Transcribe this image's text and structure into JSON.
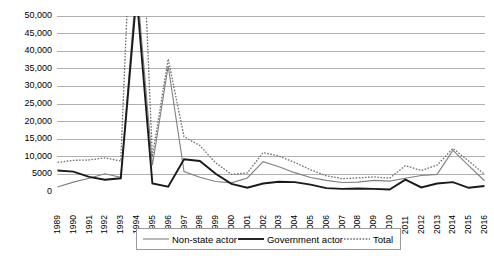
{
  "chart_data": {
    "type": "line",
    "title": "",
    "subtitle": "",
    "xlabel": "",
    "ylabel": "",
    "ylim": [
      0,
      50000
    ],
    "xlim": [
      "1989",
      "2016"
    ],
    "grid": true,
    "legend_position": "bottom",
    "ytick_labels": [
      "50,000",
      "45,000",
      "40,000",
      "35,000",
      "30,000",
      "25,000",
      "20,000",
      "15,000",
      "10,000",
      "5000",
      "0"
    ],
    "ytick_values": [
      50000,
      45000,
      40000,
      35000,
      30000,
      25000,
      20000,
      15000,
      10000,
      5000,
      0
    ],
    "categories": [
      "1989",
      "1990",
      "1991",
      "1992",
      "1993",
      "1994",
      "1995",
      "1996",
      "1997",
      "1998",
      "1999",
      "2000",
      "2001",
      "2002",
      "2003",
      "2004",
      "2005",
      "2006",
      "2007",
      "2008",
      "2009",
      "2010",
      "2011",
      "2012",
      "2013",
      "2014",
      "2015",
      "2016"
    ],
    "note": "1994 values exceed the plotted axis maximum and are clipped at the top of the plot area",
    "series": [
      {
        "name": "Non-state actor",
        "style": "thin-gray-solid",
        "color": "#808080",
        "values": [
          1400,
          2800,
          3900,
          5200,
          4200,
          60000,
          7600,
          35800,
          5800,
          4200,
          3000,
          2600,
          4000,
          8600,
          7200,
          5500,
          4100,
          3300,
          2700,
          2800,
          3300,
          3100,
          3900,
          4700,
          5000,
          11800,
          7500,
          3200
        ]
      },
      {
        "name": "Government actor",
        "style": "thick-black-solid",
        "color": "#1a1a1a",
        "values": [
          6100,
          5800,
          4300,
          3500,
          3900,
          56000,
          2400,
          1500,
          9300,
          8800,
          5200,
          2300,
          1200,
          2400,
          2900,
          2800,
          2100,
          1100,
          900,
          1000,
          900,
          700,
          3500,
          1300,
          2400,
          2800,
          1200,
          1700
        ]
      },
      {
        "name": "Total",
        "style": "dotted",
        "color": "#6e6e6e",
        "values": [
          8400,
          9000,
          9100,
          9700,
          8800,
          116000,
          10000,
          37800,
          15700,
          13200,
          8300,
          5000,
          5400,
          11200,
          10200,
          8400,
          6300,
          4600,
          3800,
          4000,
          4300,
          3900,
          7500,
          6100,
          7600,
          12400,
          8800,
          5000
        ]
      }
    ]
  },
  "legend": {
    "entries": [
      {
        "label": "Non-state actor",
        "swatch": "thin-gray-line-swatch"
      },
      {
        "label": "Government actor",
        "swatch": "thick-black-line-swatch"
      },
      {
        "label": "Total",
        "swatch": "dotted-line-swatch"
      }
    ]
  },
  "colors": {
    "gridline": "#b0b0b0",
    "non_state": "#808080",
    "government": "#1a1a1a",
    "total": "#6e6e6e",
    "legend_border": "#9a9a9a",
    "background": "#ffffff"
  }
}
